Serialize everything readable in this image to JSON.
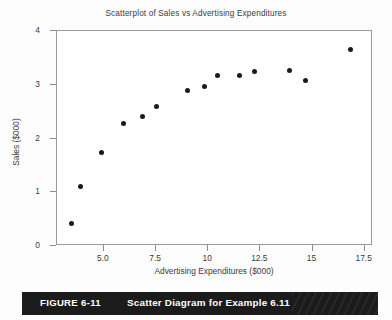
{
  "figure": {
    "caption_number": "FIGURE 6-11",
    "caption_text": "Scatter Diagram for Example 6.11",
    "caption_bar_color": "#1b1b1b",
    "caption_text_color": "#ffffff"
  },
  "chart_data": {
    "type": "scatter",
    "title": "Scatterplot of Sales vs Advertising Expenditures",
    "xlabel": "Advertising Expenditures ($000)",
    "ylabel": "Sales ($000)",
    "xlim": [
      2.75,
      17.9
    ],
    "ylim": [
      0,
      4
    ],
    "xticks": [
      5.0,
      7.5,
      10,
      12.5,
      15,
      17.5
    ],
    "xtick_labels": [
      "5.0",
      "7.5",
      "10",
      "12.5",
      "15",
      "17.5"
    ],
    "yticks": [
      0,
      1,
      2,
      3,
      4
    ],
    "ytick_labels": [
      "0",
      "1",
      "2",
      "3",
      "4"
    ],
    "grid": false,
    "legend": false,
    "marker_color": "#1a1a1a",
    "marker_size_px": 5,
    "points": [
      {
        "x": 3.45,
        "y": 0.42
      },
      {
        "x": 3.9,
        "y": 1.1
      },
      {
        "x": 4.9,
        "y": 1.74
      },
      {
        "x": 5.95,
        "y": 2.28
      },
      {
        "x": 6.83,
        "y": 2.41
      },
      {
        "x": 7.53,
        "y": 2.6
      },
      {
        "x": 9.03,
        "y": 2.89
      },
      {
        "x": 9.83,
        "y": 2.97
      },
      {
        "x": 10.45,
        "y": 3.18
      },
      {
        "x": 11.5,
        "y": 3.18
      },
      {
        "x": 12.22,
        "y": 3.25
      },
      {
        "x": 13.91,
        "y": 3.27
      },
      {
        "x": 14.66,
        "y": 3.07
      },
      {
        "x": 16.83,
        "y": 3.65
      }
    ]
  }
}
